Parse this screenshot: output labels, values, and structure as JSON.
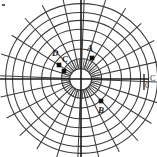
{
  "figure": {
    "title": "",
    "width": 157,
    "height": 157,
    "background": "#ffffff",
    "line_color": "#3c3c3c",
    "axis_color": "#1a1a1a",
    "marker_color": "#111111"
  },
  "grid": {
    "type": "polar",
    "center_x": 81,
    "center_y": 79,
    "inner_radius": 11,
    "ring_radii": [
      11,
      20,
      30,
      40,
      50,
      59,
      68,
      76
    ],
    "ring_count": 8,
    "spoke_count_outer": 24,
    "spoke_count_inner": 48,
    "grid_visible": true
  },
  "axes": {
    "horizontal": {
      "y": 79,
      "x_start": 0,
      "x_end": 157,
      "label": "C"
    },
    "vertical": {
      "x": 81,
      "y_start": 0,
      "y_end": 157,
      "label": ""
    },
    "origin_label": "0"
  },
  "chart_data": {
    "type": "scatter",
    "title": "",
    "xlabel": "C",
    "ylabel": "",
    "coordinate_system": "polar",
    "grid": true,
    "legend": "none",
    "points": [
      {
        "label": "D",
        "x": 59,
        "y": 65,
        "label_x": 52,
        "label_y": 49,
        "marker": "square"
      },
      {
        "label": "C",
        "x": 64,
        "y": 71,
        "label_x": 62,
        "label_y": 55,
        "marker": "square"
      },
      {
        "label": "A",
        "x": 92,
        "y": 58,
        "label_x": 87,
        "label_y": 44,
        "marker": "square"
      },
      {
        "label": "B",
        "x": 101,
        "y": 101,
        "label_x": 98,
        "label_y": 106,
        "marker": "square"
      }
    ]
  },
  "labels": {
    "axis_right": "C",
    "origin": "0"
  }
}
